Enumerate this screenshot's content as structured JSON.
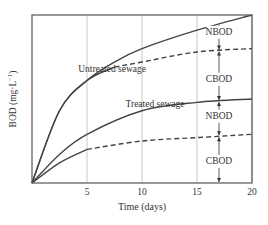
{
  "chart_data": {
    "type": "line",
    "title": "",
    "xlabel": "Time (days)",
    "ylabel": "BOD (mg·L⁻¹)",
    "ylabel_main": "BOD (mg·L",
    "ylabel_sup": "−1",
    "ylabel_close": ")",
    "xlim": [
      0,
      20
    ],
    "ylim": [
      0,
      100
    ],
    "x_ticks": [
      5,
      10,
      15,
      20
    ],
    "x_tick_labels": [
      "5",
      "10",
      "15",
      "20"
    ],
    "y_ticks": [],
    "grid": {
      "vertical": [
        5,
        10,
        15,
        20
      ],
      "horizontal": false
    },
    "series": [
      {
        "name": "Untreated sewage (total BOD)",
        "style": "solid",
        "x": [
          0,
          2.5,
          5,
          7.5,
          10,
          15,
          20
        ],
        "values": [
          0,
          43,
          61,
          72,
          80,
          91,
          100
        ]
      },
      {
        "name": "Untreated sewage (CBOD)",
        "style": "solid-then-dashed",
        "dash_from_x": 7.5,
        "x": [
          0,
          2.5,
          5,
          7.5,
          10,
          15,
          20
        ],
        "values": [
          0,
          43,
          61,
          69,
          72,
          78,
          80
        ]
      },
      {
        "name": "Treated sewage (total BOD)",
        "style": "solid",
        "x": [
          0,
          2.5,
          5,
          10,
          15,
          20
        ],
        "values": [
          0,
          17,
          29,
          43,
          48,
          50
        ]
      },
      {
        "name": "Treated sewage (CBOD)",
        "style": "solid-then-dashed",
        "dash_from_x": 5,
        "x": [
          0,
          2.5,
          5,
          10,
          15,
          20
        ],
        "values": [
          0,
          12,
          20,
          25,
          27,
          29
        ]
      }
    ],
    "annotations": [
      {
        "text": "Untreated sewage",
        "x": 4.2,
        "y": 68
      },
      {
        "text": "Treated sewage",
        "x": 8.5,
        "y": 47
      },
      {
        "text": "NBOD",
        "x": 17,
        "y": 90,
        "group": "untreated"
      },
      {
        "text": "CBOD",
        "x": 17,
        "y": 62,
        "group": "untreated"
      },
      {
        "text": "NBOD",
        "x": 17,
        "y": 40,
        "group": "treated"
      },
      {
        "text": "CBOD",
        "x": 17,
        "y": 13,
        "group": "treated"
      }
    ],
    "arrow_x": 17
  }
}
